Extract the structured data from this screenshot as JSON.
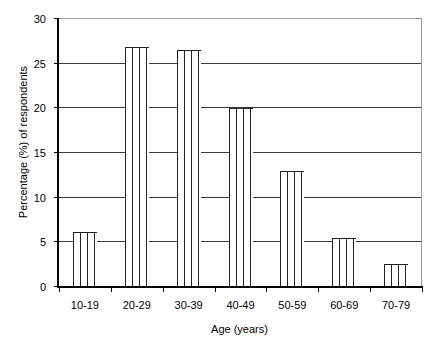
{
  "chart_data": {
    "type": "bar",
    "title": "",
    "xlabel": "Age (years)",
    "ylabel": "Percentage (%) of respondents",
    "categories": [
      "10-19",
      "20-29",
      "30-39",
      "40-49",
      "50-59",
      "60-69",
      "70-79"
    ],
    "values": [
      6.0,
      26.8,
      26.4,
      19.9,
      12.9,
      5.4,
      2.5
    ],
    "ylim": [
      0,
      30
    ],
    "yticks": [
      0,
      5,
      10,
      15,
      20,
      25,
      30
    ],
    "ytick_labels": [
      "0",
      "5",
      "10",
      "15",
      "20",
      "25",
      "30"
    ],
    "grid": true,
    "grid_axis": "y",
    "legend": false,
    "legend_position": "none",
    "bar_fill": "#ffffff",
    "bar_pattern": "vertical-lines",
    "bar_edge_color": "#222222",
    "gridline_color": "#3a3a3a",
    "axis_color": "#000000",
    "background": "#ffffff"
  }
}
